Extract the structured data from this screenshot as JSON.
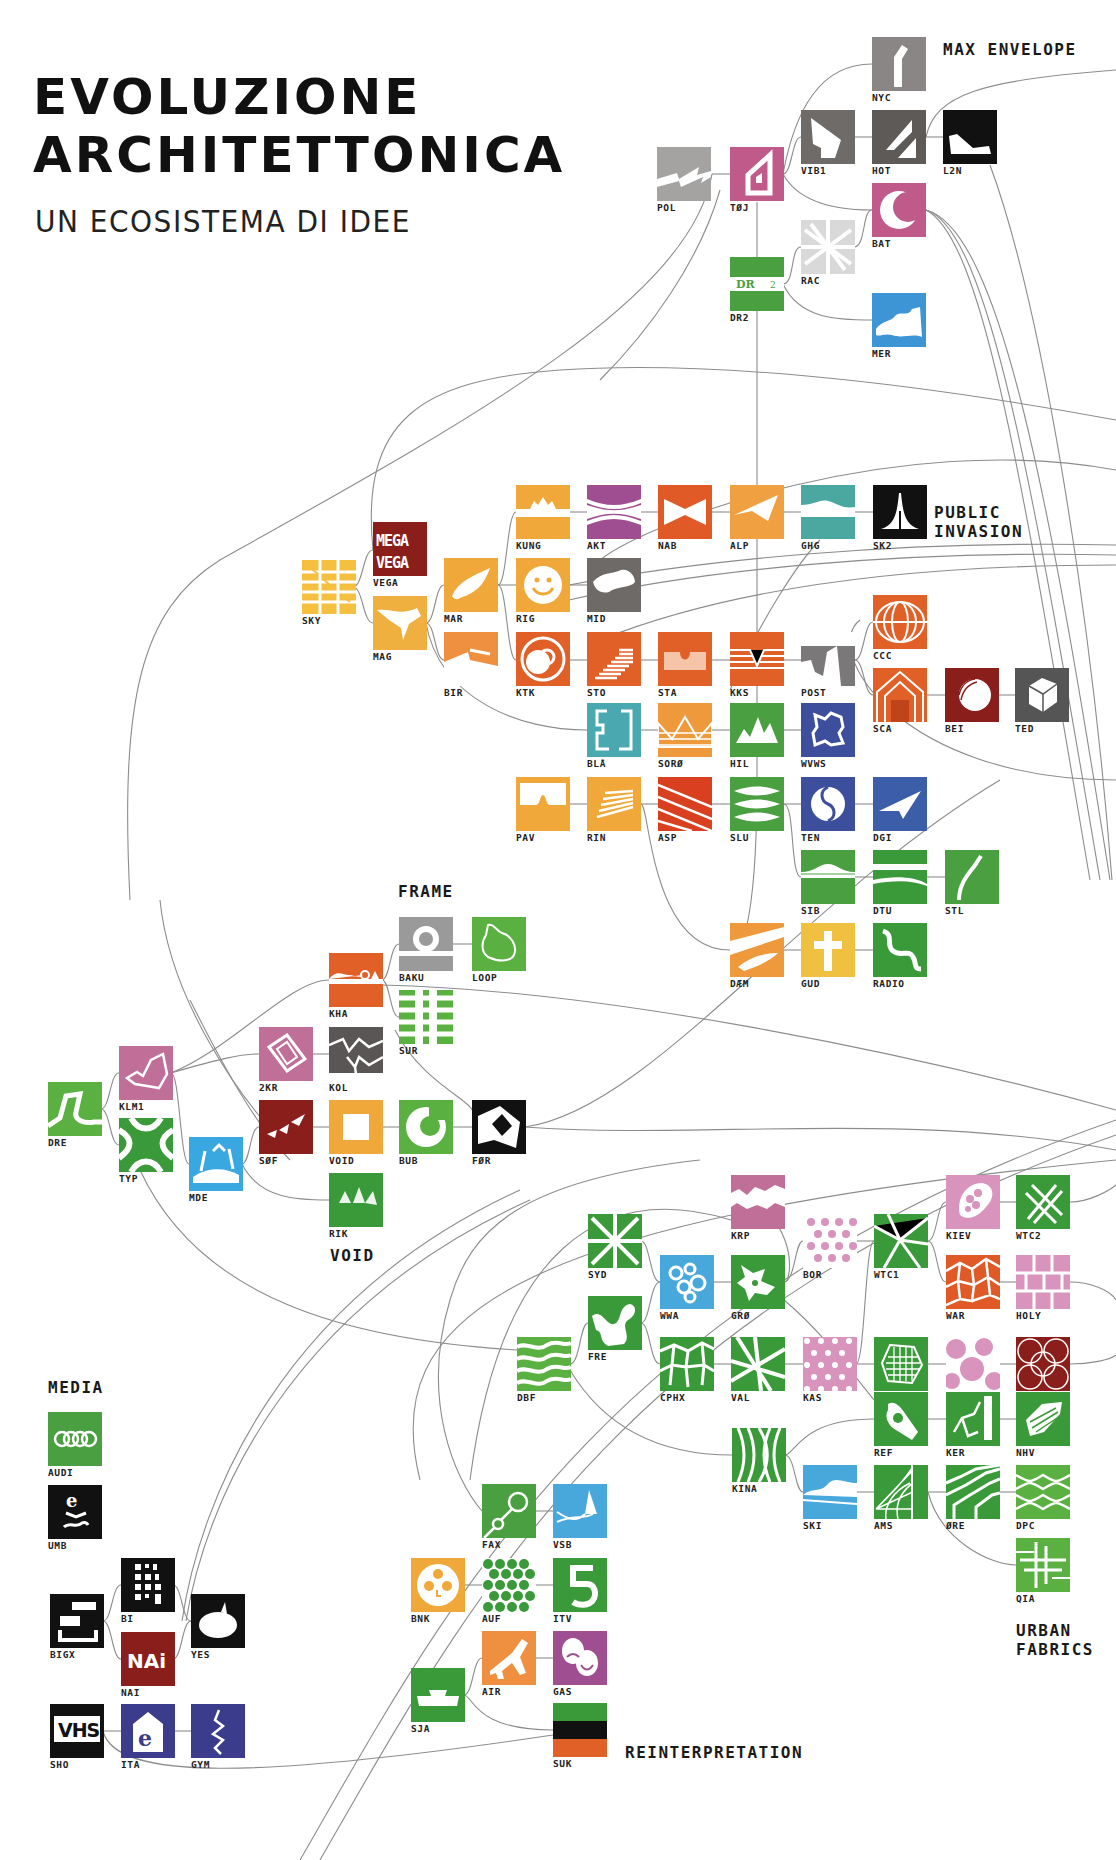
{
  "header": {
    "title_line1": "EVOLUZIONE",
    "title_line2": "ARCHITETTONICA",
    "subtitle": "UN ECOSISTEMA DI IDEE"
  },
  "groups": [
    {
      "id": "max-envelope",
      "label": "MAX ENVELOPE",
      "x": 943,
      "y": 40
    },
    {
      "id": "public-invasion",
      "label": "PUBLIC\nINVASION",
      "x": 934,
      "y": 503
    },
    {
      "id": "frame",
      "label": "FRAME",
      "x": 398,
      "y": 882
    },
    {
      "id": "void",
      "label": "VOID",
      "x": 330,
      "y": 1246
    },
    {
      "id": "media",
      "label": "MEDIA",
      "x": 48,
      "y": 1378
    },
    {
      "id": "urban-fabrics",
      "label": "URBAN\nFABRICS",
      "x": 1016,
      "y": 1621
    },
    {
      "id": "reinterpretation",
      "label": "REINTERPRETATION",
      "x": 625,
      "y": 1743
    }
  ],
  "colors": {
    "orange_red": "#E0602A",
    "orange": "#F0A83A",
    "green": "#3E9E3E",
    "light_green": "#5AB040",
    "pink": "#C0608E",
    "light_pink": "#D894BC",
    "purple": "#A04E92",
    "gray": "#6E6A68",
    "blue": "#3C4E9C",
    "light_blue": "#48A8DC",
    "teal": "#4AA8A8",
    "dark_red": "#8A1E1A",
    "black": "#111111",
    "line": "#8C8C8C"
  },
  "tiles": [
    {
      "code": "NYC",
      "x": 872,
      "y": 37,
      "color": "#8a8685",
      "icon": "tower"
    },
    {
      "code": "VIB1",
      "x": 801,
      "y": 110,
      "color": "#6f6b69",
      "icon": "wedge-house"
    },
    {
      "code": "HOT",
      "x": 872,
      "y": 110,
      "color": "#5e5a58",
      "icon": "slash-bars"
    },
    {
      "code": "L2N",
      "x": 943,
      "y": 110,
      "color": "#111111",
      "icon": "shoe"
    },
    {
      "code": "POL",
      "x": 657,
      "y": 147,
      "color": "#a5a3a2",
      "icon": "zigzag"
    },
    {
      "code": "TØJ",
      "x": 730,
      "y": 147,
      "color": "#c05a8a",
      "icon": "house-outline"
    },
    {
      "code": "BAT",
      "x": 872,
      "y": 183,
      "color": "#c05a8a",
      "icon": "crescent"
    },
    {
      "code": "RAC",
      "x": 801,
      "y": 220,
      "color": "#d9d9d9",
      "icon": "web-lines"
    },
    {
      "code": "DR2",
      "x": 730,
      "y": 257,
      "color": "#4aa040",
      "icon": "dr2-logo"
    },
    {
      "code": "MER",
      "x": 872,
      "y": 293,
      "color": "#3d95d6",
      "icon": "wave-rock"
    },
    {
      "code": "KUNG",
      "x": 516,
      "y": 485,
      "color": "#f0a83a",
      "icon": "crown-band"
    },
    {
      "code": "AKT",
      "x": 587,
      "y": 485,
      "color": "#a04e92",
      "icon": "hourglass"
    },
    {
      "code": "NAB",
      "x": 658,
      "y": 485,
      "color": "#e05a28",
      "icon": "bowtie"
    },
    {
      "code": "ALP",
      "x": 730,
      "y": 485,
      "color": "#f0a040",
      "icon": "folded-plane"
    },
    {
      "code": "GHG",
      "x": 801,
      "y": 485,
      "color": "#4aa8a0",
      "icon": "wave-band"
    },
    {
      "code": "SK2",
      "x": 873,
      "y": 485,
      "color": "#111111",
      "icon": "spike-tower"
    },
    {
      "code": "VEGA",
      "x": 373,
      "y": 522,
      "color": "#8a1e1a",
      "icon": "mega-vega"
    },
    {
      "code": "SKY",
      "x": 302,
      "y": 560,
      "color": "#f5c040",
      "icon": "grid-stairs"
    },
    {
      "code": "MAR",
      "x": 444,
      "y": 558,
      "color": "#f0a83a",
      "icon": "leaf-blob"
    },
    {
      "code": "RIG",
      "x": 516,
      "y": 558,
      "color": "#f0a83a",
      "icon": "smiley"
    },
    {
      "code": "MID",
      "x": 587,
      "y": 558,
      "color": "#6e6a68",
      "icon": "rock-blob"
    },
    {
      "code": "MAG",
      "x": 373,
      "y": 596,
      "color": "#f0b040",
      "icon": "bird-shape"
    },
    {
      "code": "CCC",
      "x": 873,
      "y": 595,
      "color": "#e06028",
      "icon": "lens-lines"
    },
    {
      "code": "BIR",
      "x": 444,
      "y": 632,
      "color": "#ee9040",
      "icon": "slope-wedge"
    },
    {
      "code": "KTK",
      "x": 516,
      "y": 632,
      "color": "#e06028",
      "icon": "ring-globe"
    },
    {
      "code": "STO",
      "x": 587,
      "y": 632,
      "color": "#e06028",
      "icon": "steps"
    },
    {
      "code": "STA",
      "x": 658,
      "y": 632,
      "color": "#e06028",
      "icon": "notch-band"
    },
    {
      "code": "KKS",
      "x": 730,
      "y": 632,
      "color": "#e06028",
      "icon": "v-notch-lines"
    },
    {
      "code": "POST",
      "x": 801,
      "y": 632,
      "color": "#7a7878",
      "icon": "cliff"
    },
    {
      "code": "SCA",
      "x": 873,
      "y": 668,
      "color": "#e06028",
      "icon": "nested-house"
    },
    {
      "code": "BEI",
      "x": 945,
      "y": 668,
      "color": "#8a1e1a",
      "icon": "shell"
    },
    {
      "code": "TED",
      "x": 1015,
      "y": 668,
      "color": "#555555",
      "icon": "cube"
    },
    {
      "code": "BLÅ",
      "x": 587,
      "y": 703,
      "color": "#4aa8b0",
      "icon": "brackets"
    },
    {
      "code": "SORØ",
      "x": 658,
      "y": 703,
      "color": "#ee9a3c",
      "icon": "zigzag-roof"
    },
    {
      "code": "HIL",
      "x": 730,
      "y": 703,
      "color": "#4aa040",
      "icon": "peaks"
    },
    {
      "code": "WVWS",
      "x": 801,
      "y": 703,
      "color": "#3c4e9c",
      "icon": "jagged-square"
    },
    {
      "code": "PAV",
      "x": 516,
      "y": 777,
      "color": "#f0a83a",
      "icon": "bump"
    },
    {
      "code": "RIN",
      "x": 587,
      "y": 777,
      "color": "#f0a83a",
      "icon": "fan-lines"
    },
    {
      "code": "ASP",
      "x": 658,
      "y": 777,
      "color": "#d84020",
      "icon": "diagonal-stripes"
    },
    {
      "code": "SLU",
      "x": 730,
      "y": 777,
      "color": "#4aa040",
      "icon": "lens-stack"
    },
    {
      "code": "TEN",
      "x": 801,
      "y": 777,
      "color": "#3c4e9c",
      "icon": "yin-yang"
    },
    {
      "code": "DGI",
      "x": 873,
      "y": 777,
      "color": "#3c5ea8",
      "icon": "paper-plane"
    },
    {
      "code": "SIB",
      "x": 801,
      "y": 850,
      "color": "#4aa040",
      "icon": "hill-band"
    },
    {
      "code": "DTU",
      "x": 873,
      "y": 850,
      "color": "#3a9a3a",
      "icon": "split-band"
    },
    {
      "code": "STL",
      "x": 945,
      "y": 850,
      "color": "#4aa040",
      "icon": "arc-stroke"
    },
    {
      "code": "DÆM",
      "x": 730,
      "y": 923,
      "color": "#ee9a3c",
      "icon": "dam-sweep"
    },
    {
      "code": "GUD",
      "x": 801,
      "y": 923,
      "color": "#f0c040",
      "icon": "cross"
    },
    {
      "code": "RADIO",
      "x": 873,
      "y": 923,
      "color": "#3a9a3a",
      "icon": "snake"
    },
    {
      "code": "BAKU",
      "x": 399,
      "y": 917,
      "color": "#9a9a9a",
      "icon": "ring-bar"
    },
    {
      "code": "LOOP",
      "x": 472,
      "y": 917,
      "color": "#5ab040",
      "icon": "island"
    },
    {
      "code": "KHA",
      "x": 329,
      "y": 953,
      "color": "#e06028",
      "icon": "skyline-ring"
    },
    {
      "code": "SUR",
      "x": 399,
      "y": 990,
      "color": "#5ab040",
      "icon": "ladder"
    },
    {
      "code": "2KR",
      "x": 259,
      "y": 1027,
      "color": "#c07098",
      "icon": "tilted-rect"
    },
    {
      "code": "KOL",
      "x": 329,
      "y": 1027,
      "color": "#5a5656",
      "icon": "crack-map"
    },
    {
      "code": "KLM1",
      "x": 119,
      "y": 1046,
      "color": "#c07098",
      "icon": "outline-map"
    },
    {
      "code": "DRE",
      "x": 48,
      "y": 1082,
      "color": "#5ab040",
      "icon": "s-road"
    },
    {
      "code": "SØF",
      "x": 259,
      "y": 1100,
      "color": "#8a1e1a",
      "icon": "shards"
    },
    {
      "code": "VOID",
      "x": 329,
      "y": 1100,
      "color": "#f0a83a",
      "icon": "hollow-square"
    },
    {
      "code": "BUB",
      "x": 399,
      "y": 1100,
      "color": "#5ab040",
      "icon": "c-ring"
    },
    {
      "code": "FØR",
      "x": 472,
      "y": 1100,
      "color": "#111111",
      "icon": "shield-diamond"
    },
    {
      "code": "TYP",
      "x": 119,
      "y": 1118,
      "color": "#3a9a3a",
      "icon": "curvy-x"
    },
    {
      "code": "MDE",
      "x": 189,
      "y": 1137,
      "color": "#3aa8e0",
      "icon": "frame-hills"
    },
    {
      "code": "RIK",
      "x": 329,
      "y": 1173,
      "color": "#3a9a3a",
      "icon": "tri-peaks"
    },
    {
      "code": "KRP",
      "x": 731,
      "y": 1175,
      "color": "#c07098",
      "icon": "torn-band"
    },
    {
      "code": "KIEV",
      "x": 946,
      "y": 1175,
      "color": "#d894bc",
      "icon": "cell-blob"
    },
    {
      "code": "WTC2",
      "x": 1016,
      "y": 1175,
      "color": "#3a9a3a",
      "icon": "lattice"
    },
    {
      "code": "SYD",
      "x": 588,
      "y": 1214,
      "color": "#3a9a3a",
      "icon": "burst"
    },
    {
      "code": "BOR",
      "x": 803,
      "y": 1214,
      "color": "#d894bc",
      "icon": "dot-grid"
    },
    {
      "code": "WTC1",
      "x": 874,
      "y": 1214,
      "color": "#3a9a3a",
      "icon": "crack-lines"
    },
    {
      "code": "WWA",
      "x": 660,
      "y": 1255,
      "color": "#48a8dc",
      "icon": "bubbles"
    },
    {
      "code": "GRØ",
      "x": 731,
      "y": 1255,
      "color": "#3a9a3a",
      "icon": "splat"
    },
    {
      "code": "WAR",
      "x": 946,
      "y": 1255,
      "color": "#e05a28",
      "icon": "voronoi"
    },
    {
      "code": "HOLY",
      "x": 1016,
      "y": 1255,
      "color": "#d894bc",
      "icon": "brick-grid"
    },
    {
      "code": "FRE",
      "x": 588,
      "y": 1296,
      "color": "#3a9a3a",
      "icon": "blob-path"
    },
    {
      "code": "DBF",
      "x": 517,
      "y": 1337,
      "color": "#5ab040",
      "icon": "wavy-stripes"
    },
    {
      "code": "CPHX",
      "x": 660,
      "y": 1337,
      "color": "#3a9a3a",
      "icon": "cobble"
    },
    {
      "code": "VAL",
      "x": 731,
      "y": 1337,
      "color": "#3a9a3a",
      "icon": "crossing-lines"
    },
    {
      "code": "KAS",
      "x": 803,
      "y": 1337,
      "color": "#d894bc",
      "icon": "hex-dots"
    },
    {
      "code": "TERM",
      "x": 874,
      "y": 1337,
      "color": "#3a9a3a",
      "icon": "hatched-hex"
    },
    {
      "code": "LEEDS",
      "x": 946,
      "y": 1337,
      "color": "#d894bc",
      "icon": "big-circles"
    },
    {
      "code": "UTR",
      "x": 1016,
      "y": 1337,
      "color": "#8a1e1a",
      "icon": "circle-mesh"
    },
    {
      "code": "REF",
      "x": 874,
      "y": 1392,
      "color": "#3a9a3a",
      "icon": "hand-ok"
    },
    {
      "code": "KER",
      "x": 946,
      "y": 1392,
      "color": "#3a9a3a",
      "icon": "branch-bar"
    },
    {
      "code": "NHV",
      "x": 1016,
      "y": 1392,
      "color": "#3a9a3a",
      "icon": "cone-mesh"
    },
    {
      "code": "KINA",
      "x": 732,
      "y": 1428,
      "color": "#3a9a3a",
      "icon": "bulge-lines"
    },
    {
      "code": "SKI",
      "x": 803,
      "y": 1465,
      "color": "#48a8dc",
      "icon": "mountain-band"
    },
    {
      "code": "AMS",
      "x": 874,
      "y": 1465,
      "color": "#3a9a3a",
      "icon": "radial-grid"
    },
    {
      "code": "ØRE",
      "x": 946,
      "y": 1465,
      "color": "#3a9a3a",
      "icon": "step-lines"
    },
    {
      "code": "DPC",
      "x": 1016,
      "y": 1465,
      "color": "#5ab040",
      "icon": "diamond-mesh"
    },
    {
      "code": "QIA",
      "x": 1016,
      "y": 1538,
      "color": "#5ab040",
      "icon": "hash-grid"
    },
    {
      "code": "AUDI",
      "x": 48,
      "y": 1412,
      "color": "#4aa040",
      "icon": "four-rings"
    },
    {
      "code": "UMB",
      "x": 48,
      "y": 1485,
      "color": "#111111",
      "icon": "e-wave"
    },
    {
      "code": "BI",
      "x": 121,
      "y": 1558,
      "color": "#111111",
      "icon": "window-grid"
    },
    {
      "code": "BIGX",
      "x": 50,
      "y": 1594,
      "color": "#111111",
      "icon": "stacked-boxes"
    },
    {
      "code": "YES",
      "x": 191,
      "y": 1594,
      "color": "#111111",
      "icon": "speech-bubble"
    },
    {
      "code": "NAI",
      "x": 121,
      "y": 1632,
      "color": "#8a1e1a",
      "icon": "nai-logo"
    },
    {
      "code": "SHO",
      "x": 50,
      "y": 1704,
      "color": "#111111",
      "icon": "vhs-logo"
    },
    {
      "code": "ITA",
      "x": 121,
      "y": 1704,
      "color": "#3c3c8c",
      "icon": "e-house"
    },
    {
      "code": "GYM",
      "x": 191,
      "y": 1704,
      "color": "#3c3c8c",
      "icon": "squiggle"
    },
    {
      "code": "FAX",
      "x": 482,
      "y": 1484,
      "color": "#4aa040",
      "icon": "lollipop"
    },
    {
      "code": "VSB",
      "x": 553,
      "y": 1484,
      "color": "#48a8dc",
      "icon": "spike-curve"
    },
    {
      "code": "BNK",
      "x": 411,
      "y": 1558,
      "color": "#f0a83a",
      "icon": "dot-circle"
    },
    {
      "code": "AUF",
      "x": 482,
      "y": 1558,
      "color": "#3a9a3a",
      "icon": "dot-pattern"
    },
    {
      "code": "ITV",
      "x": 553,
      "y": 1558,
      "color": "#3a9a3a",
      "icon": "numeral-five"
    },
    {
      "code": "AIR",
      "x": 482,
      "y": 1631,
      "color": "#ee9040",
      "icon": "airplane"
    },
    {
      "code": "GAS",
      "x": 553,
      "y": 1631,
      "color": "#a04e92",
      "icon": "theatre-masks"
    },
    {
      "code": "SJA",
      "x": 411,
      "y": 1668,
      "color": "#3a9a3a",
      "icon": "bowl"
    },
    {
      "code": "SUK",
      "x": 553,
      "y": 1703,
      "color": "#3a9a3a",
      "icon": "tricolor-stripes",
      "stripes": [
        "#3a9a3a",
        "#111111",
        "#e06028"
      ]
    }
  ]
}
